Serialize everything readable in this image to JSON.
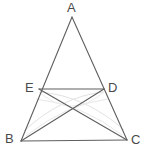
{
  "figure": {
    "background_color": "#ffffff",
    "line_color": "#5f5f5f",
    "construction_arc_color": "#e2e2e2",
    "label_color": "#4a4a4a",
    "canvas": {
      "width": 150,
      "height": 161
    }
  },
  "points": {
    "A": {
      "name": "A",
      "x": 72,
      "y": 17
    },
    "B": {
      "name": "B",
      "x": 21,
      "y": 141
    },
    "C": {
      "name": "C",
      "x": 127,
      "y": 140
    },
    "D": {
      "name": "D",
      "x": 104,
      "y": 89
    },
    "E": {
      "name": "E",
      "x": 39,
      "y": 89
    }
  },
  "labels": {
    "A": {
      "text": "A",
      "x": 67,
      "y": 1
    },
    "B": {
      "text": "B",
      "x": 5,
      "y": 132
    },
    "C": {
      "text": "C",
      "x": 131,
      "y": 133
    },
    "D": {
      "text": "D",
      "x": 108,
      "y": 81
    },
    "E": {
      "text": "E",
      "x": 25,
      "y": 81
    }
  },
  "segments": [
    {
      "name": "side-AB",
      "from": "A",
      "to": "B"
    },
    {
      "name": "side-AC",
      "from": "A",
      "to": "C"
    },
    {
      "name": "side-BC",
      "from": "B",
      "to": "C"
    },
    {
      "name": "segment-ED",
      "from": "E",
      "to": "D"
    },
    {
      "name": "cevian-BD",
      "from": "B",
      "to": "D"
    },
    {
      "name": "cevian-CE",
      "from": "C",
      "to": "E"
    }
  ],
  "intersection": {
    "name": "BD-CE-crossing",
    "x": 74,
    "y": 112
  },
  "construction_arcs": [
    {
      "name": "arc-from-B-upper",
      "d": "M 24 131 Q 62 96 104 92"
    },
    {
      "name": "arc-from-C-upper",
      "d": "M 124 130 Q 86 96 40 92"
    },
    {
      "name": "arc-from-B-lower",
      "d": "M 26 136 Q 66 104 108 99"
    },
    {
      "name": "arc-from-C-lower",
      "d": "M 122 135 Q 82 104 36 99"
    },
    {
      "name": "arc-span-E-D",
      "d": "M 39 92 Q 72 120 104 92"
    }
  ]
}
